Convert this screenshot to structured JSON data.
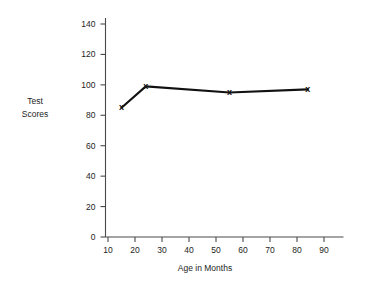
{
  "chart_data": {
    "type": "line",
    "title": "",
    "xlabel": "Age in Months",
    "ylabel": "Test Scores",
    "ylabel_lines": [
      "Test",
      "Scores"
    ],
    "x": [
      15,
      24,
      55,
      84
    ],
    "values": [
      85,
      99,
      95,
      97
    ],
    "series": [
      {
        "name": "Test Scores",
        "x": [
          15,
          24,
          55,
          84
        ],
        "values": [
          85,
          99,
          95,
          97
        ]
      }
    ],
    "xlim": [
      5,
      95
    ],
    "ylim": [
      0,
      140
    ],
    "xticks": [
      10,
      20,
      30,
      40,
      50,
      60,
      70,
      80,
      90
    ],
    "xtick_labels": [
      "10",
      "20",
      "30",
      "40",
      "50",
      "60",
      "70",
      "80",
      "90"
    ],
    "yticks": [
      0,
      20,
      40,
      60,
      80,
      100,
      120,
      140
    ],
    "ytick_labels": [
      "0",
      "20",
      "40",
      "60",
      "80",
      "100",
      "120",
      "140"
    ],
    "grid": false,
    "legend": false,
    "legend_position": "none",
    "marker": "x",
    "marker_symbol": "x",
    "line_color": "#111111",
    "axis_color": "#4a4a4a",
    "background_color": "#ffffff"
  },
  "axis": {
    "x_title": "Age in Months",
    "y_title_line1": "Test",
    "y_title_line2": "Scores"
  }
}
